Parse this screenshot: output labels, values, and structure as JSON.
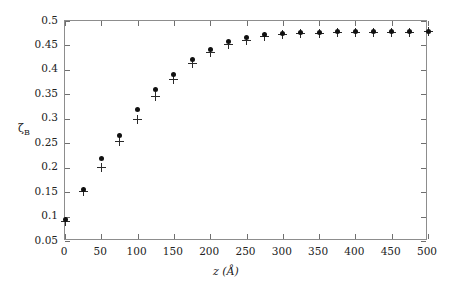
{
  "chart_data": {
    "type": "scatter",
    "title": "",
    "xlabel": "z (Å)",
    "ylabel": "ζB",
    "ylabel_base": "ζ",
    "ylabel_sub": "B",
    "xlim": [
      0,
      500
    ],
    "ylim": [
      0.05,
      0.5
    ],
    "xticks": [
      0,
      50,
      100,
      150,
      200,
      250,
      300,
      350,
      400,
      450,
      500
    ],
    "xtick_labels": [
      "0",
      "50",
      "100",
      "150",
      "200",
      "250",
      "300",
      "350",
      "400",
      "450",
      "500"
    ],
    "yticks": [
      0.05,
      0.1,
      0.15,
      0.2,
      0.25,
      0.3,
      0.35,
      0.4,
      0.45,
      0.5
    ],
    "ytick_labels": [
      "0.05",
      "0.1",
      "0.15",
      "0.2",
      "0.25",
      "0.3",
      "0.35",
      "0.4",
      "0.45",
      "0.5"
    ],
    "grid": false,
    "legend": "none",
    "frame": true,
    "marker_color": "#111111",
    "frame_color": "#8d8d8d",
    "background": "#ffffff",
    "x": [
      0,
      25,
      50,
      75,
      100,
      125,
      150,
      175,
      200,
      225,
      250,
      275,
      300,
      325,
      350,
      375,
      400,
      425,
      450,
      475,
      500
    ],
    "series": [
      {
        "name": "filled-circle",
        "marker": "circle",
        "values": [
          0.093,
          0.155,
          0.219,
          0.266,
          0.319,
          0.359,
          0.39,
          0.421,
          0.442,
          0.458,
          0.466,
          0.472,
          0.475,
          0.476,
          0.477,
          0.478,
          0.478,
          0.478,
          0.478,
          0.478,
          0.479
        ]
      },
      {
        "name": "plus",
        "marker": "plus",
        "values": [
          0.09,
          0.152,
          0.2,
          0.253,
          0.299,
          0.345,
          0.381,
          0.413,
          0.436,
          0.452,
          0.461,
          0.468,
          0.472,
          0.474,
          0.475,
          0.476,
          0.476,
          0.476,
          0.477,
          0.477,
          0.478
        ]
      }
    ]
  }
}
